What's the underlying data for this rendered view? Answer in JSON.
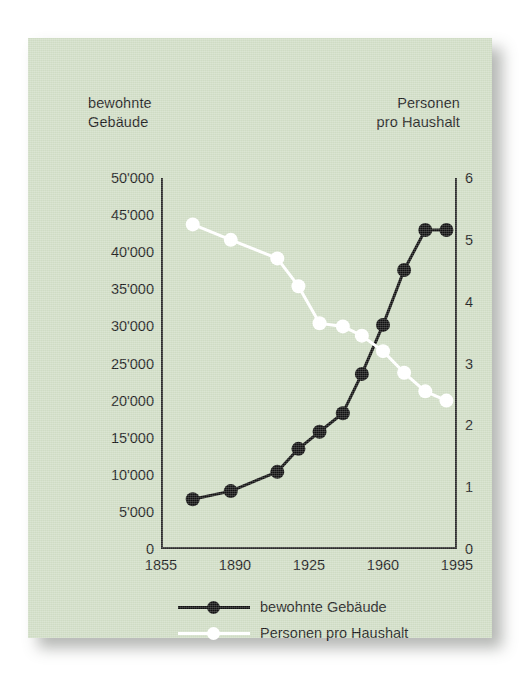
{
  "chart_data": {
    "type": "line",
    "title": "",
    "subtitle": "",
    "xlabel": "",
    "ylabel_left": "bewohnte Gebäude",
    "ylabel_right": "Personen pro Haushalt",
    "grid": false,
    "legend_position": "bottom",
    "x": [
      1870,
      1880,
      1888,
      1900,
      1910,
      1920,
      1930,
      1941,
      1950,
      1960,
      1970,
      1980,
      1990
    ],
    "xlim": [
      1855,
      1995
    ],
    "xticks": [
      "1855",
      "1890",
      "1925",
      "1960",
      "1995"
    ],
    "xtick_values": [
      1855,
      1890,
      1925,
      1960,
      1995
    ],
    "ylim_left": [
      0,
      50000
    ],
    "yticks_left": [
      "0",
      "5'000",
      "10'000",
      "15'000",
      "20'000",
      "25'000",
      "30'000",
      "35'000",
      "40'000",
      "45'000",
      "50'000"
    ],
    "ytick_values_left": [
      0,
      5000,
      10000,
      15000,
      20000,
      25000,
      30000,
      35000,
      40000,
      45000,
      50000
    ],
    "ylim_right": [
      0,
      6
    ],
    "yticks_right": [
      "0",
      "1",
      "2",
      "3",
      "4",
      "5",
      "6"
    ],
    "ytick_values_right": [
      0,
      1,
      2,
      3,
      4,
      5,
      6
    ],
    "series": [
      {
        "name": "bewohnte Gebäude",
        "axis": "left",
        "color": "#111111",
        "marker": "filled-circle",
        "x": [
          1870,
          1888,
          1910,
          1920,
          1930,
          1941,
          1950,
          1960,
          1970,
          1980,
          1990
        ],
        "values": [
          6700,
          7800,
          10400,
          13500,
          15800,
          18300,
          23600,
          30200,
          37600,
          43000,
          43000
        ]
      },
      {
        "name": "Personen pro Haushalt",
        "axis": "right",
        "color": "#ffffff",
        "marker": "open-circle",
        "x": [
          1870,
          1888,
          1910,
          1920,
          1930,
          1941,
          1950,
          1960,
          1970,
          1980,
          1990
        ],
        "values": [
          5.25,
          5.0,
          4.7,
          4.25,
          3.65,
          3.6,
          3.45,
          3.2,
          2.85,
          2.55,
          2.4
        ]
      }
    ]
  },
  "axis_headings": {
    "left": "bewohnte\nGebäude",
    "right": "Personen\npro Haushalt"
  },
  "legend": {
    "items": [
      {
        "label": "bewohnte Gebäude",
        "color": "#111111"
      },
      {
        "label": "Personen pro Haushalt",
        "color": "#ffffff"
      }
    ]
  },
  "colors": {
    "card_background": "#cfdcc4",
    "page_background": "#ffffff",
    "axis": "#2a2a2a",
    "text": "#1b1b1b",
    "series_buildings": "#111111",
    "series_household": "#ffffff"
  }
}
